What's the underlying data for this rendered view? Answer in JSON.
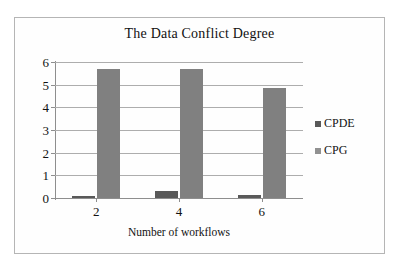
{
  "chart_data": {
    "type": "bar",
    "title": "The Data Conflict Degree",
    "xlabel": "Number of workflows",
    "ylabel": "",
    "categories": [
      "2",
      "4",
      "6"
    ],
    "series": [
      {
        "name": "CPDE",
        "color": "#595959",
        "values": [
          0.1,
          0.3,
          0.15
        ]
      },
      {
        "name": "CPG",
        "color": "#808080",
        "values": [
          5.68,
          5.7,
          4.87
        ]
      }
    ],
    "ylim": [
      0,
      6
    ],
    "ytick_step": 1,
    "yticks": [
      "6",
      "5",
      "4",
      "3",
      "2",
      "1",
      "0"
    ],
    "grid": true,
    "legend_position": "right"
  },
  "legend": {
    "items": [
      {
        "label": "CPDE",
        "swatch": "legend-swatch-cpde"
      },
      {
        "label": "CPG",
        "swatch": "legend-swatch-cpg"
      }
    ]
  }
}
